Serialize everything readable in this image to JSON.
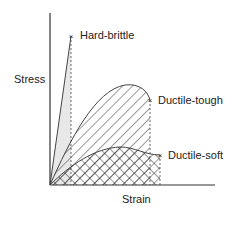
{
  "diagram": {
    "y_axis_label": "Stress",
    "x_axis_label": "Strain",
    "line_color": "#333333",
    "curves": [
      {
        "id": "hard-brittle",
        "label": "Hard-brittle",
        "fill": "light shading (small area)",
        "end": [
          71,
          36
        ]
      },
      {
        "id": "ductile-tough",
        "label": "Ductile-tough",
        "fill": "diagonal hatch (large area)",
        "end": [
          150,
          71
        ]
      },
      {
        "id": "ductile-soft",
        "label": "Ductile-soft",
        "fill": "cross hatch (small area)",
        "end": [
          160,
          155
        ]
      }
    ]
  }
}
